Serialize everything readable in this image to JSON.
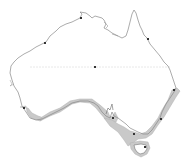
{
  "map": {
    "subject": "Australia",
    "type": "species distribution range map",
    "colors": {
      "background": "#ffffff",
      "land": "#ffffff",
      "coastline": "#8a8a8a",
      "range_fill": "#c8c8c8",
      "range_stroke": "#a0a0a0",
      "city_dot": "#333333",
      "tropic_line": "#e6e6e6"
    },
    "range_regions": [
      "southwest Western Australia coast",
      "southern coast (Great Australian Bight)",
      "South Australia gulfs",
      "Victoria coast",
      "New South Wales coast",
      "southern Queensland coast",
      "Tasmania"
    ],
    "city_dots": [
      {
        "name": "darwin",
        "x": 81,
        "y": 18
      },
      {
        "name": "broome",
        "x": 45,
        "y": 43
      },
      {
        "name": "cairns",
        "x": 147,
        "y": 39
      },
      {
        "name": "alice-springs",
        "x": 95,
        "y": 67
      },
      {
        "name": "brisbane",
        "x": 173,
        "y": 90
      },
      {
        "name": "perth",
        "x": 24,
        "y": 108
      },
      {
        "name": "adelaide",
        "x": 113,
        "y": 118
      },
      {
        "name": "sydney",
        "x": 160,
        "y": 119
      },
      {
        "name": "melbourne",
        "x": 134,
        "y": 134
      },
      {
        "name": "hobart",
        "x": 145,
        "y": 147
      }
    ]
  }
}
